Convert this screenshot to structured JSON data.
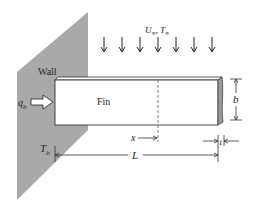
{
  "diagram": {
    "labels": {
      "wall": "Wall",
      "fin": "Fin",
      "heat_flow": "q",
      "heat_flow_sub": "b",
      "base_temp": "T",
      "base_temp_sub": "b",
      "flow_velocity": "U",
      "flow_velocity_sub": "∞",
      "flow_sep": ",",
      "flow_temp": "T",
      "flow_temp_sub": "∞",
      "position": "x",
      "length": "L",
      "height": "b",
      "thickness": "t"
    },
    "flow_arrow_count": 7,
    "colors": {
      "wall_fill": "#a9a9a9",
      "fin_fill": "#ffffff",
      "fin_end_fill": "#9a9a9a",
      "line": "#333333"
    }
  }
}
